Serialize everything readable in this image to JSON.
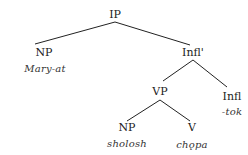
{
  "diagram": {
    "type": "syntax-tree",
    "nodes": {
      "ip": {
        "label": "IP"
      },
      "np_subject": {
        "label": "NP",
        "word": "Mary-at"
      },
      "infl_bar": {
        "label": "Infl'"
      },
      "vp": {
        "label": "VP"
      },
      "infl": {
        "label": "Infl",
        "word": "-tok"
      },
      "np_object": {
        "label": "NP",
        "word": "sholosh"
      },
      "v": {
        "label": "V",
        "word": "chǫpa"
      }
    },
    "edges": [
      [
        "IP",
        "NP"
      ],
      [
        "IP",
        "Infl'"
      ],
      [
        "Infl'",
        "VP"
      ],
      [
        "Infl'",
        "Infl"
      ],
      [
        "VP",
        "NP"
      ],
      [
        "VP",
        "V"
      ]
    ],
    "line_color": "#222222"
  }
}
